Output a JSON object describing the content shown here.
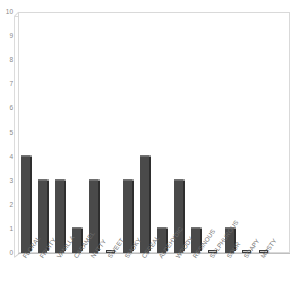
{
  "chart_data": {
    "type": "bar",
    "title": "",
    "subtitle": "",
    "xlabel": "",
    "ylabel": "",
    "ylim": [
      0,
      10
    ],
    "ytick_labels": [
      "10",
      "9",
      "8",
      "7",
      "6",
      "5",
      "4",
      "3",
      "2",
      "1",
      "0"
    ],
    "ytick_values": [
      10,
      9,
      8,
      7,
      6,
      5,
      4,
      3,
      2,
      1,
      0
    ],
    "grid": false,
    "legend": false,
    "legend_position": "none",
    "categories": [
      "FLORAL",
      "FRUITY",
      "VANILLA",
      "CARAMEL",
      "NUTTY",
      "SWEET",
      "SMOKY",
      "CEREAL",
      "ALDEHYDIC",
      "WOODY",
      "RESINOUS",
      "SULPHUROUS",
      "SOUR",
      "SOAPY",
      "MUSTY"
    ],
    "values": [
      4,
      3,
      3,
      1,
      3,
      0,
      3,
      4,
      1,
      3,
      1,
      0,
      1,
      0,
      0
    ],
    "series": [
      {
        "name": "count",
        "values": [
          4,
          3,
          3,
          1,
          3,
          0,
          3,
          4,
          1,
          3,
          1,
          0,
          1,
          0,
          0
        ]
      }
    ],
    "colors": {
      "bar_front": "#4a4a4a",
      "bar_side": "#2e2e2e",
      "bar_top": "#6f6f6f",
      "plot_background": "#ffffff",
      "frame": "#d9d9d9",
      "axis_text": "#8a8a8a",
      "baseline": "#bfbfbf"
    }
  }
}
